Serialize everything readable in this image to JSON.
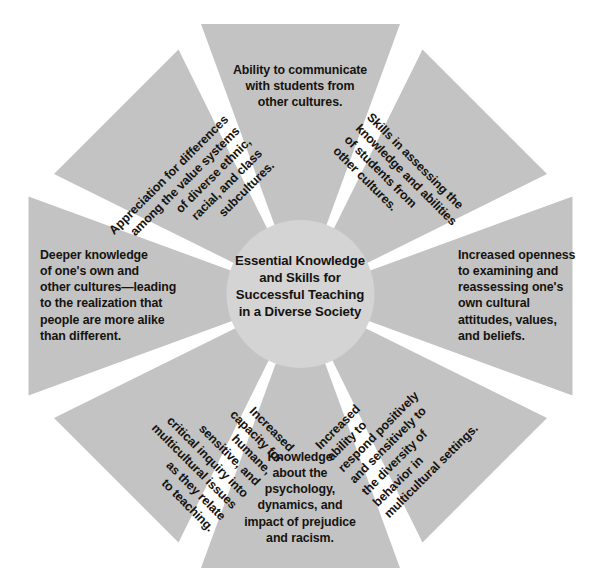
{
  "diagram": {
    "type": "radial-pinwheel",
    "wedge_count": 8,
    "colors": {
      "wedge_fill": "#c3c3c3",
      "hub_fill": "#d4d4d4",
      "text": "#16130f",
      "background": "#ffffff"
    },
    "hub": {
      "text": "Essential Knowledge\nand Skills for\nSuccessful Teaching\nin a Diverse Society"
    },
    "wedges": [
      {
        "position": "top",
        "angle_deg": 0,
        "text": "Ability to communicate\nwith students from\nother cultures."
      },
      {
        "position": "top-right",
        "angle_deg": 45,
        "text": "Skills in assessing the\nknowledge and abilities\nof students from\nother cultures."
      },
      {
        "position": "right",
        "angle_deg": 90,
        "text": "Increased openness\nto examining and\nreassessing one's\nown cultural\nattitudes, values,\nand beliefs."
      },
      {
        "position": "bottom-right",
        "angle_deg": 135,
        "text": "Increased\nability to\nrespond positively\nand sensitively to\nthe diversity of\nbehavior in\nmulticultural settings."
      },
      {
        "position": "bottom",
        "angle_deg": 180,
        "text": "Knowledge\nabout the\npsychology,\ndynamics, and\nimpact of prejudice\nand racism."
      },
      {
        "position": "bottom-left",
        "angle_deg": 225,
        "text": "Increased\ncapacity for\nhumane,\nsensitive, and\ncritical inquiry into\nmulticultural issues\nas they relate\nto teaching."
      },
      {
        "position": "left",
        "angle_deg": 270,
        "text": "Deeper knowledge\nof one's own and\nother cultures—leading\nto the realization that\npeople are more alike\nthan different."
      },
      {
        "position": "top-left",
        "angle_deg": 315,
        "text": "Appreciation for differences\namong the value systems\nof diverse ethnic,\nracial, and class\nsubcultures."
      }
    ]
  }
}
